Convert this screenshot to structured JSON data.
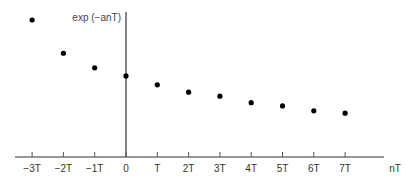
{
  "chart_data": {
    "type": "scatter",
    "title": "",
    "ylabel": "exp (−anT)",
    "xlabel": "nT",
    "categories": [
      "−3T",
      "−2T",
      "−1T",
      "0",
      "T",
      "2T",
      "3T",
      "4T",
      "5T",
      "6T",
      "7T"
    ],
    "x": [
      -3,
      -2,
      -1,
      0,
      1,
      2,
      3,
      4,
      5,
      6,
      7
    ],
    "values": [
      1.69,
      1.28,
      1.1,
      1.0,
      0.89,
      0.8,
      0.75,
      0.67,
      0.63,
      0.57,
      0.54
    ],
    "ylim": [
      0,
      1.8
    ],
    "grid": false,
    "legend": "none",
    "point_color": "#000000",
    "axis_color": "#333333"
  }
}
